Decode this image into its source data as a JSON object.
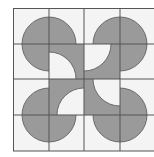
{
  "figure": {
    "grid": {
      "rows": 4,
      "cols": 4,
      "x_lines": [
        13,
        49,
        84,
        120,
        155
      ],
      "y_lines": [
        8,
        44,
        79,
        115,
        151
      ]
    },
    "colors": {
      "background": "#f4f4f4",
      "shade": "#9a9a9a",
      "line": "#555555",
      "cutout": "#f4f4f4"
    },
    "circles": [
      {
        "name": "top-left-circle",
        "cx": 49,
        "cy": 44,
        "r": 27
      },
      {
        "name": "top-right-circle",
        "cx": 120,
        "cy": 44,
        "r": 27
      },
      {
        "name": "bottom-left-circle",
        "cx": 49,
        "cy": 115,
        "r": 27
      },
      {
        "name": "bottom-right-circle",
        "cx": 120,
        "cy": 115,
        "r": 27
      }
    ],
    "center_square": {
      "x": 49,
      "y": 44,
      "w": 71,
      "h": 71
    },
    "cutouts": [
      {
        "name": "cutout-top-left",
        "cx": 49,
        "cy": 79,
        "r": 27
      },
      {
        "name": "cutout-top-right",
        "cx": 84,
        "cy": 44,
        "r": 27
      },
      {
        "name": "cutout-bottom-left",
        "cx": 84,
        "cy": 115,
        "r": 27
      },
      {
        "name": "cutout-bottom-right",
        "cx": 120,
        "cy": 79,
        "r": 27
      }
    ]
  }
}
